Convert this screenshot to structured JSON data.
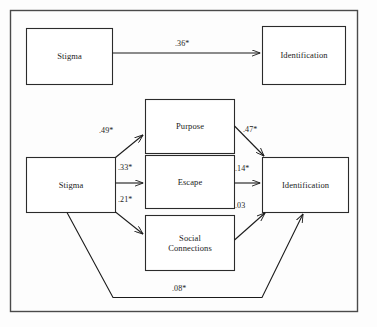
{
  "figure": {
    "type": "path-diagram",
    "caption": "",
    "frame": {
      "stroke": "#4a4a4a",
      "fill": "#fdfdfd"
    },
    "node_style": {
      "stroke": "#2b2b2b",
      "fill": "#ffffff"
    },
    "edge_style": {
      "stroke": "#1b1b1b"
    }
  },
  "models": [
    {
      "name": "direct-effect-model",
      "nodes": [
        {
          "id": "stigma_top",
          "label": "Stigma"
        },
        {
          "id": "identification_top",
          "label": "Identification"
        }
      ],
      "edges": [
        {
          "from": "stigma_top",
          "to": "identification_top",
          "label": ".36*"
        }
      ]
    },
    {
      "name": "mediation-model",
      "nodes": [
        {
          "id": "stigma_mid",
          "label": "Stigma"
        },
        {
          "id": "purpose",
          "label": "Purpose"
        },
        {
          "id": "escape",
          "label": "Escape"
        },
        {
          "id": "social_connections_line1",
          "label": "Social"
        },
        {
          "id": "social_connections_line2",
          "label": "Connections"
        },
        {
          "id": "identification_mid",
          "label": "Identification"
        }
      ],
      "edges": [
        {
          "from": "stigma_mid",
          "to": "purpose",
          "label": ".49*"
        },
        {
          "from": "stigma_mid",
          "to": "escape",
          "label": ".33*"
        },
        {
          "from": "stigma_mid",
          "to": "social_connections",
          "label": ".21*"
        },
        {
          "from": "purpose",
          "to": "identification_mid",
          "label": ".47*"
        },
        {
          "from": "escape",
          "to": "identification_mid",
          "label": ".14*"
        },
        {
          "from": "social_connections",
          "to": "identification_mid",
          "label": ".03"
        },
        {
          "from": "stigma_mid",
          "to": "identification_mid",
          "label": ".08*"
        }
      ]
    }
  ],
  "labels": {
    "stigma_top": "Stigma",
    "identification_top": "Identification",
    "stigma_mid": "Stigma",
    "purpose": "Purpose",
    "escape": "Escape",
    "social_line1": "Social",
    "social_line2": "Connections",
    "identification_mid": "Identification",
    "coef_stigma_identification_direct": ".36*",
    "coef_stigma_purpose": ".49*",
    "coef_stigma_escape": ".33*",
    "coef_stigma_social": ".21*",
    "coef_purpose_identification": ".47*",
    "coef_escape_identification": ".14*",
    "coef_social_identification": ".03",
    "coef_stigma_identification_indirect": ".08*"
  }
}
